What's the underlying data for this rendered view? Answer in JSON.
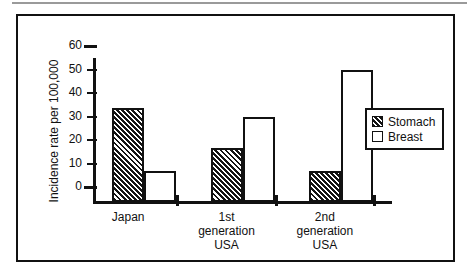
{
  "chart_data": {
    "type": "bar",
    "title": "",
    "xlabel": "",
    "ylabel": "Incidence rate per 100,000",
    "categories": [
      "Japan",
      "1st generation USA",
      "2nd generation USA"
    ],
    "category_lines": [
      [
        "Japan"
      ],
      [
        "1st",
        "generation",
        "USA"
      ],
      [
        "2nd",
        "generation",
        "USA"
      ]
    ],
    "series": [
      {
        "name": "Stomach",
        "values": [
          40,
          23,
          13
        ],
        "fill": "hatched",
        "color": "#141414"
      },
      {
        "name": "Breast",
        "values": [
          13,
          36,
          56
        ],
        "fill": "white",
        "color": "#ffffff"
      }
    ],
    "ylim": [
      0,
      60
    ],
    "yticks": [
      0,
      10,
      20,
      30,
      40,
      50,
      60
    ],
    "ytick_labels": [
      "0",
      "10",
      "20",
      "30",
      "40",
      "50",
      "60"
    ],
    "grid": false,
    "legend_position": "right"
  },
  "axis": {
    "y_title": "Incidence rate per 100,000",
    "ticks": [
      {
        "value": 60,
        "label": "60"
      },
      {
        "value": 50,
        "label": "50"
      },
      {
        "value": 40,
        "label": "40"
      },
      {
        "value": 30,
        "label": "30"
      },
      {
        "value": 20,
        "label": "20"
      },
      {
        "value": 10,
        "label": "10"
      },
      {
        "value": 0,
        "label": "0"
      }
    ]
  },
  "legend": {
    "items": [
      {
        "label": "Stomach",
        "pattern": "hatched"
      },
      {
        "label": "Breast",
        "pattern": "white"
      }
    ]
  },
  "groups": [
    {
      "label_lines": [
        "Japan"
      ],
      "stomach": 40,
      "breast": 13
    },
    {
      "label_lines": [
        "1st",
        "generation",
        "USA"
      ],
      "stomach": 23,
      "breast": 36
    },
    {
      "label_lines": [
        "2nd",
        "generation",
        "USA"
      ],
      "stomach": 13,
      "breast": 56
    }
  ]
}
